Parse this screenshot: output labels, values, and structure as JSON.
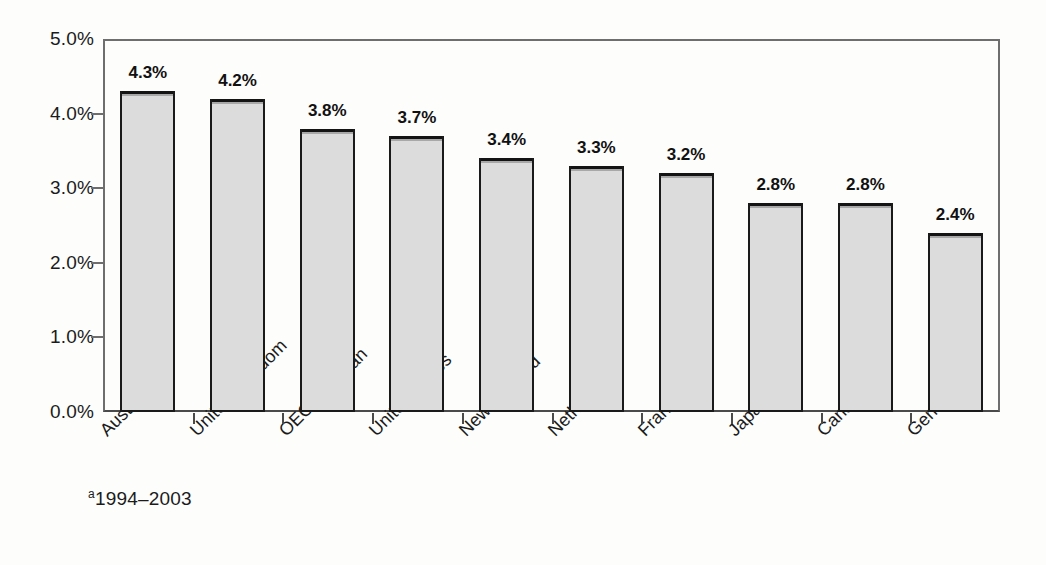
{
  "chart_data": {
    "type": "bar",
    "title": "",
    "xlabel": "",
    "ylabel": "",
    "ylim": [
      0,
      5
    ],
    "grid": false,
    "legend": "none",
    "categories": [
      "Australia",
      "United Kingdom",
      "OECD Median",
      "United States",
      "New Zealand",
      "Netherlands",
      "France",
      "Japan",
      "Canada",
      "Germany"
    ],
    "category_footnote_markers": [
      "a",
      "",
      "",
      "",
      "",
      "",
      "",
      "a",
      "",
      "a"
    ],
    "values": [
      4.3,
      4.2,
      3.8,
      3.7,
      3.4,
      3.3,
      3.2,
      2.8,
      2.8,
      2.4
    ],
    "value_labels": [
      "4.3%",
      "4.2%",
      "3.8%",
      "3.7%",
      "3.4%",
      "3.3%",
      "3.2%",
      "2.8%",
      "2.8%",
      "2.4%"
    ],
    "y_tick_values": [
      0,
      1,
      2,
      3,
      4,
      5
    ],
    "y_tick_labels": [
      "0.0%",
      "1.0%",
      "2.0%",
      "3.0%",
      "4.0%",
      "5.0%"
    ],
    "bar_fill_color": "#dcdcdc",
    "bar_border_color": "#1a1a1a",
    "axis_color": "#4a4a4a",
    "background_color": "#fdfdfc"
  },
  "footnote": {
    "marker": "a",
    "text": "1994–2003"
  }
}
